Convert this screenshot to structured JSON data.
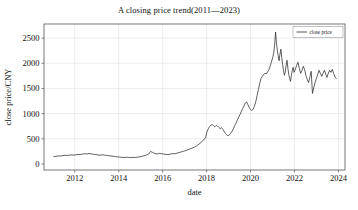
{
  "chart_data": {
    "type": "line",
    "title": "A closing price trend(2011—2023)",
    "xlabel": "date",
    "ylabel": "close price/CNY",
    "grid": true,
    "legend_position": "upper right",
    "xlim": [
      2010.6,
      2024.3
    ],
    "ylim": [
      -120,
      2780
    ],
    "xticks": [
      2012,
      2014,
      2016,
      2018,
      2020,
      2022,
      2024
    ],
    "xtick_labels": [
      "2012",
      "2014",
      "2016",
      "2018",
      "2020",
      "2022",
      "2024"
    ],
    "yticks": [
      0,
      500,
      1000,
      1500,
      2000,
      2500
    ],
    "ytick_labels": [
      "0",
      "500",
      "1000",
      "1500",
      "2000",
      "2500"
    ],
    "line_color": "#2b2b2b",
    "series": [
      {
        "name": "close price",
        "x": [
          2011.05,
          2011.15,
          2011.25,
          2011.35,
          2011.45,
          2011.55,
          2011.65,
          2011.75,
          2011.85,
          2011.95,
          2012.05,
          2012.15,
          2012.25,
          2012.35,
          2012.45,
          2012.55,
          2012.65,
          2012.75,
          2012.85,
          2012.95,
          2013.05,
          2013.15,
          2013.25,
          2013.35,
          2013.45,
          2013.55,
          2013.65,
          2013.75,
          2013.85,
          2013.95,
          2014.05,
          2014.15,
          2014.25,
          2014.35,
          2014.45,
          2014.55,
          2014.65,
          2014.75,
          2014.85,
          2014.95,
          2015.05,
          2015.15,
          2015.25,
          2015.35,
          2015.45,
          2015.55,
          2015.65,
          2015.75,
          2015.85,
          2015.95,
          2016.05,
          2016.15,
          2016.25,
          2016.35,
          2016.45,
          2016.55,
          2016.65,
          2016.75,
          2016.85,
          2016.95,
          2017.05,
          2017.15,
          2017.25,
          2017.35,
          2017.45,
          2017.55,
          2017.65,
          2017.75,
          2017.85,
          2017.95,
          2018.02,
          2018.08,
          2018.14,
          2018.2,
          2018.26,
          2018.32,
          2018.38,
          2018.44,
          2018.5,
          2018.56,
          2018.62,
          2018.68,
          2018.74,
          2018.8,
          2018.86,
          2018.92,
          2018.98,
          2019.04,
          2019.1,
          2019.16,
          2019.22,
          2019.28,
          2019.34,
          2019.4,
          2019.46,
          2019.52,
          2019.58,
          2019.64,
          2019.7,
          2019.76,
          2019.82,
          2019.88,
          2019.94,
          2020.0,
          2020.06,
          2020.12,
          2020.18,
          2020.24,
          2020.3,
          2020.36,
          2020.42,
          2020.48,
          2020.54,
          2020.6,
          2020.66,
          2020.72,
          2020.78,
          2020.84,
          2020.9,
          2020.96,
          2021.02,
          2021.06,
          2021.1,
          2021.14,
          2021.18,
          2021.22,
          2021.26,
          2021.3,
          2021.34,
          2021.38,
          2021.42,
          2021.46,
          2021.5,
          2021.54,
          2021.58,
          2021.62,
          2021.66,
          2021.7,
          2021.74,
          2021.78,
          2021.82,
          2021.86,
          2021.9,
          2021.94,
          2021.98,
          2022.04,
          2022.1,
          2022.16,
          2022.22,
          2022.28,
          2022.34,
          2022.4,
          2022.46,
          2022.52,
          2022.58,
          2022.64,
          2022.7,
          2022.76,
          2022.82,
          2022.88,
          2022.94,
          2023.0,
          2023.06,
          2023.12,
          2023.18,
          2023.24,
          2023.3,
          2023.36,
          2023.42,
          2023.48,
          2023.54,
          2023.6,
          2023.66,
          2023.72,
          2023.78,
          2023.84,
          2023.9
        ],
        "y": [
          145,
          152,
          160,
          158,
          166,
          172,
          168,
          175,
          180,
          176,
          182,
          190,
          186,
          196,
          205,
          198,
          208,
          200,
          192,
          186,
          180,
          174,
          182,
          176,
          170,
          164,
          158,
          152,
          146,
          140,
          136,
          132,
          128,
          134,
          130,
          126,
          132,
          128,
          136,
          142,
          150,
          162,
          176,
          192,
          248,
          228,
          206,
          198,
          210,
          204,
          196,
          190,
          186,
          196,
          206,
          200,
          214,
          226,
          240,
          252,
          266,
          282,
          300,
          316,
          336,
          362,
          392,
          430,
          470,
          520,
          640,
          700,
          745,
          770,
          782,
          762,
          740,
          768,
          752,
          726,
          700,
          722,
          690,
          648,
          604,
          576,
          560,
          578,
          612,
          650,
          700,
          760,
          812,
          870,
          930,
          980,
          1040,
          1100,
          1150,
          1210,
          1230,
          1180,
          1120,
          1080,
          1060,
          1090,
          1150,
          1240,
          1360,
          1480,
          1600,
          1700,
          1740,
          1780,
          1800,
          1790,
          1830,
          1870,
          1950,
          2040,
          2130,
          2220,
          2380,
          2620,
          2400,
          2260,
          2150,
          2050,
          2180,
          2280,
          2120,
          1980,
          1860,
          1760,
          1820,
          1960,
          2060,
          1900,
          1780,
          1700,
          1640,
          1760,
          1860,
          1920,
          1820,
          1880,
          1960,
          2020,
          1900,
          1800,
          1860,
          1940,
          1880,
          1760,
          1680,
          1620,
          1720,
          1840,
          1400,
          1520,
          1620,
          1700,
          1780,
          1860,
          1800,
          1740,
          1800,
          1860,
          1790,
          1720,
          1800,
          1860,
          1820,
          1880,
          1800,
          1730,
          1700
        ]
      }
    ]
  },
  "legend": {
    "entries": [
      {
        "label": "close price",
        "color": "#2b2b2b"
      }
    ]
  }
}
